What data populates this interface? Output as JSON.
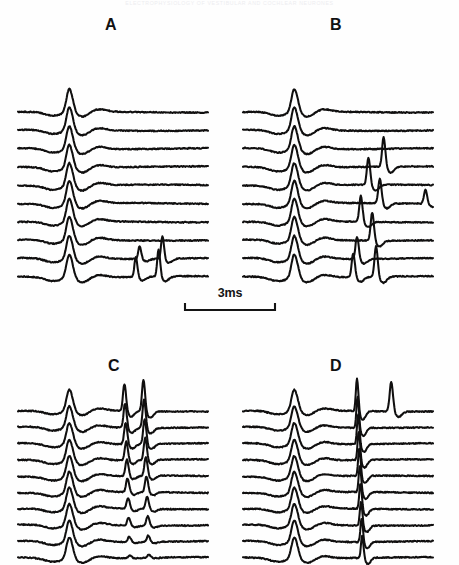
{
  "figure": {
    "running_head": "ELECTROPHYSIOLOGY OF VESTIBULAR AND COCHLEAR NEURONES",
    "background_color": "#ffffff",
    "trace_color": "#100f0f",
    "label_color": "#111111",
    "width": 459,
    "height": 565
  },
  "scalebar": {
    "label": "3ms",
    "x_start": 185,
    "x_end": 265,
    "y": 303,
    "cap_height": 8
  },
  "panels": [
    {
      "id": "A",
      "label": "A",
      "label_x": 112,
      "label_y": 26,
      "origin_x": 24,
      "origin_y": 96,
      "width": 190,
      "trace_count": 10,
      "trace_spacing": 18.3,
      "description": "Ten stacked extracellular traces; single large primary spike at about 27 percent of sweep; bottom two traces show an additional late double-spike complex at about 62 to 76 percent of sweep."
    },
    {
      "id": "B",
      "label": "B",
      "label_x": 336,
      "label_y": 26,
      "origin_x": 249,
      "origin_y": 96,
      "width": 190,
      "trace_count": 10,
      "trace_spacing": 18.3,
      "description": "Ten stacked traces; primary spike at about 27 percent; prominent late spike cluster from trace 4 through trace 10 at about 55 to 80 percent, with a small terminal spike on trace 6 near the right edge."
    },
    {
      "id": "C",
      "label": "C",
      "label_x": 112,
      "label_y": 368,
      "origin_x": 24,
      "origin_y": 393,
      "width": 190,
      "trace_count": 10,
      "trace_spacing": 16.3,
      "description": "Ten stacked traces; primary spike at about 27 percent; strong secondary spike pair at about 55 to 66 percent present on all traces, tallest on the upper traces."
    },
    {
      "id": "D",
      "label": "D",
      "label_x": 336,
      "label_y": 368,
      "origin_x": 249,
      "origin_y": 393,
      "width": 190,
      "trace_count": 10,
      "trace_spacing": 16.3,
      "description": "Ten stacked traces; primary spike at about 27 percent; sharp narrow secondary spike at about 60 percent on all traces; top trace carries an additional tall isolated spike at about 78 percent."
    }
  ],
  "chart_data": {
    "type": "line",
    "title": "",
    "xlabel": "",
    "ylabel": "",
    "legend": [],
    "grid": false,
    "x_scale_bar_ms": 3,
    "sweep_units": "ms",
    "series_per_panel": 10,
    "panel_ids": [
      "A",
      "B",
      "C",
      "D"
    ],
    "spike_events": {
      "A": {
        "primary_spike_position": 0.27,
        "primary_spike_amplitude": [
          1.0,
          1.0,
          1.0,
          1.0,
          1.0,
          1.0,
          1.0,
          1.0,
          1.0,
          1.0
        ],
        "late_spikes": [
          {
            "trace": 9,
            "positions": [
              0.64,
              0.76
            ],
            "amplitudes": [
              0.55,
              0.95
            ]
          },
          {
            "trace": 10,
            "positions": [
              0.62,
              0.74
            ],
            "amplitudes": [
              0.85,
              1.15
            ]
          }
        ]
      },
      "B": {
        "primary_spike_position": 0.27,
        "primary_spike_amplitude": [
          1.0,
          1.0,
          1.0,
          1.0,
          1.0,
          1.0,
          1.0,
          1.0,
          1.0,
          1.0
        ],
        "late_spikes": [
          {
            "trace": 4,
            "positions": [
              0.74
            ],
            "amplitudes": [
              1.25
            ]
          },
          {
            "trace": 5,
            "positions": [
              0.66
            ],
            "amplitudes": [
              1.15
            ]
          },
          {
            "trace": 6,
            "positions": [
              0.72,
              0.96
            ],
            "amplitudes": [
              1.05,
              0.6
            ]
          },
          {
            "trace": 7,
            "positions": [
              0.62
            ],
            "amplitudes": [
              1.1
            ]
          },
          {
            "trace": 8,
            "positions": [
              0.68
            ],
            "amplitudes": [
              1.2
            ]
          },
          {
            "trace": 9,
            "positions": [
              0.6
            ],
            "amplitudes": [
              0.95
            ]
          },
          {
            "trace": 10,
            "positions": [
              0.58,
              0.7
            ],
            "amplitudes": [
              1.0,
              1.3
            ]
          }
        ]
      },
      "C": {
        "primary_spike_position": 0.27,
        "primary_spike_amplitude": [
          1.0,
          1.0,
          1.0,
          1.0,
          1.0,
          1.0,
          1.0,
          1.0,
          1.0,
          1.0
        ],
        "secondary_spike_positions": [
          0.56,
          0.66
        ],
        "secondary_spike_amplitudes": [
          1.25,
          1.45
        ]
      },
      "D": {
        "primary_spike_position": 0.27,
        "primary_spike_amplitude": [
          1.0,
          1.0,
          1.0,
          1.0,
          1.0,
          1.0,
          1.0,
          1.0,
          1.0,
          1.0
        ],
        "secondary_spike_position": 0.6,
        "secondary_spike_amplitude": 1.5,
        "extra_spikes": [
          {
            "trace": 1,
            "position": 0.78,
            "amplitude": 1.35
          }
        ]
      }
    }
  }
}
